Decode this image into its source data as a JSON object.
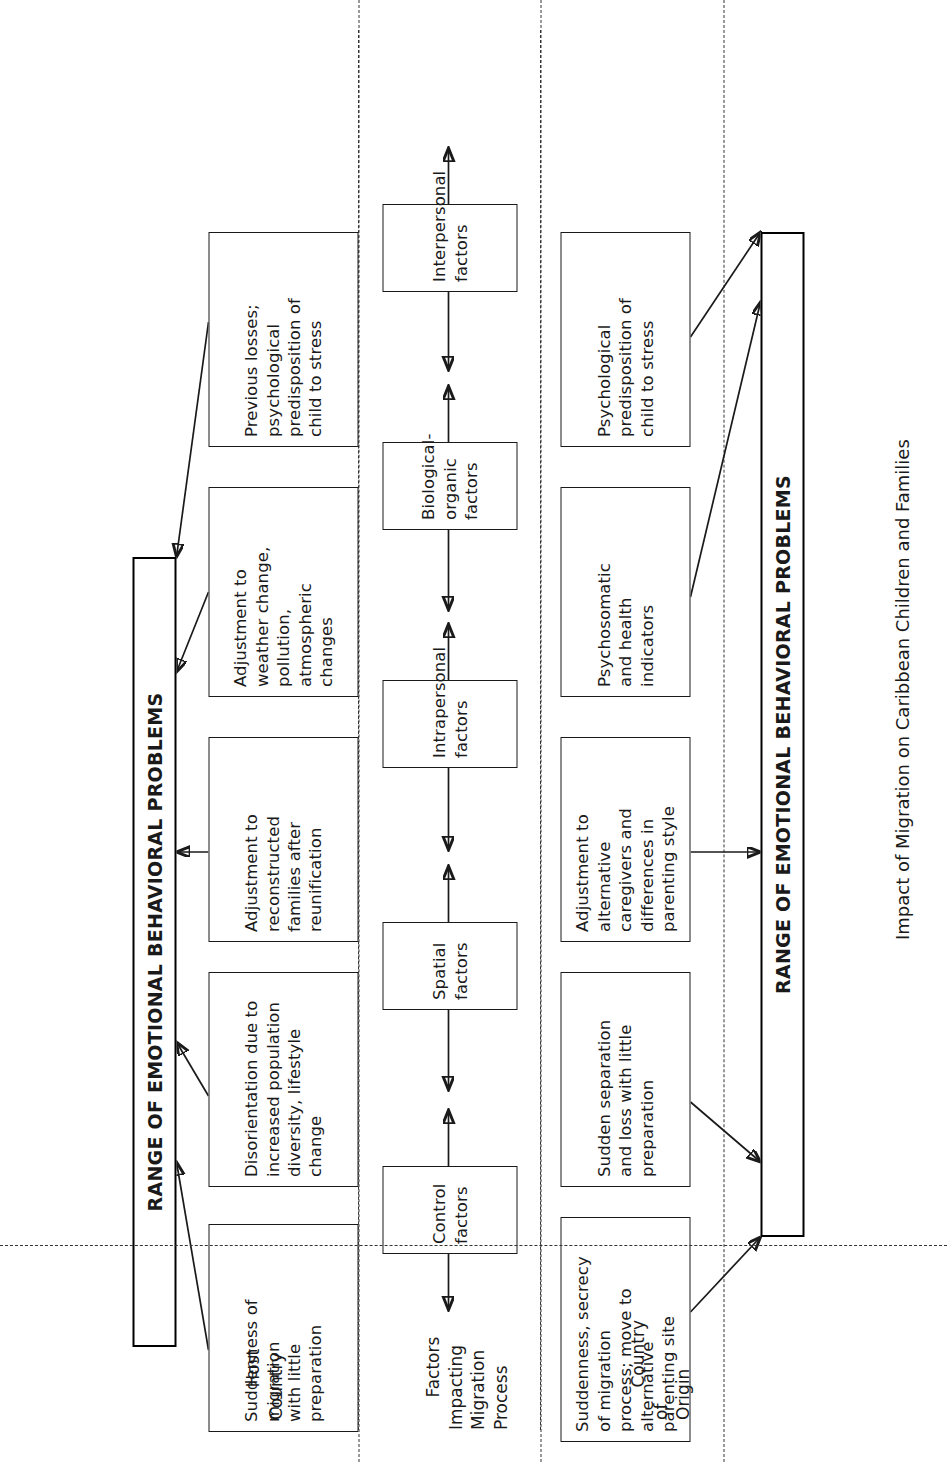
{
  "figure": {
    "caption": "Impact of Migration on Caribbean Children and Families",
    "outcome_left_label": "RANGE OF EMOTIONAL BEHAVIORAL PROBLEMS",
    "outcome_right_label": "RANGE OF EMOTIONAL BEHAVIORAL PROBLEMS"
  },
  "lanes": [
    {
      "id": "host-country",
      "label": "Host\nCountry"
    },
    {
      "id": "factors",
      "label": "Factors\nImpacting\nMigration\nProcess"
    },
    {
      "id": "country-origin",
      "label": "Country\nof\nOrigin"
    }
  ],
  "columns": [
    {
      "id": "control",
      "factor": "Control\nfactors",
      "host": "Suddenness of\nmigration\nwith little\npreparation",
      "origin": "Suddenness, secrecy\nof migration\nprocess; move to\nalternative\nparenting site"
    },
    {
      "id": "spatial",
      "factor": "Spatial\nfactors",
      "host": "Disorientation due to\nincreased population\ndiversity, lifestyle\nchange",
      "origin": "Sudden separation\nand loss with little\npreparation"
    },
    {
      "id": "intrapersonal",
      "factor": "Intrapersonal\nfactors",
      "host": "Adjustment to\nreconstructed\nfamilies after\nreunification",
      "origin": "Adjustment to\nalternative\ncaregivers and\ndifferences in\nparenting style"
    },
    {
      "id": "biological-organic",
      "factor": "Biological-\norganic\nfactors",
      "host": "Adjustment to\nweather change,\npollution,\natmospheric\nchanges",
      "origin": "Psychosomatic\nand health\nindicators"
    },
    {
      "id": "interpersonal",
      "factor": "Interpersonal\nfactors",
      "host": "Previous losses;\npsychological\npredisposition of\nchild to stress",
      "origin": "Psychological\npredisposition of\nchild to stress"
    }
  ],
  "colors": {
    "stroke": "#1a1a1a",
    "background": "#ffffff",
    "dashed_separator": "#333333"
  }
}
